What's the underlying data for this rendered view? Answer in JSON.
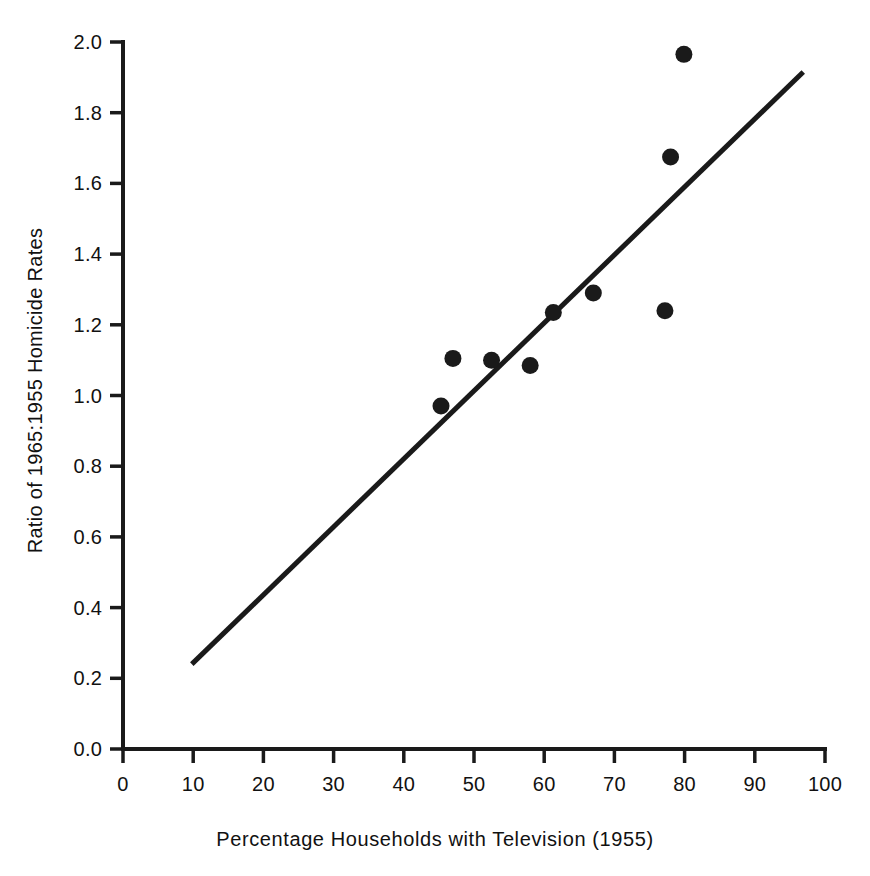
{
  "chart_data": {
    "type": "scatter",
    "title": "",
    "xlabel": "Percentage Households with Television (1955)",
    "ylabel": "Ratio of 1965:1955 Homicide Rates",
    "xlim": [
      0,
      100
    ],
    "ylim": [
      0.0,
      2.0
    ],
    "grid": false,
    "legend": "none",
    "xticks": [
      "0",
      "10",
      "20",
      "30",
      "40",
      "50",
      "60",
      "70",
      "80",
      "90",
      "100"
    ],
    "xtick_values": [
      0,
      10,
      20,
      30,
      40,
      50,
      60,
      70,
      80,
      90,
      100
    ],
    "yticks": [
      "0.0",
      "0.2",
      "0.4",
      "0.6",
      "0.8",
      "1.0",
      "1.2",
      "1.4",
      "1.6",
      "1.8",
      "2.0"
    ],
    "ytick_values": [
      0.0,
      0.2,
      0.4,
      0.6,
      0.8,
      1.0,
      1.2,
      1.4,
      1.6,
      1.8,
      2.0
    ],
    "marker_color": "#1a1a1a",
    "line_color": "#1a1a1a",
    "axis_color": "#1a1a1a",
    "points": [
      {
        "x": 45.3,
        "y": 0.97
      },
      {
        "x": 47.0,
        "y": 1.105
      },
      {
        "x": 52.5,
        "y": 1.1
      },
      {
        "x": 58.0,
        "y": 1.085
      },
      {
        "x": 61.3,
        "y": 1.235
      },
      {
        "x": 67.0,
        "y": 1.29
      },
      {
        "x": 77.2,
        "y": 1.24
      },
      {
        "x": 78.0,
        "y": 1.675
      },
      {
        "x": 79.9,
        "y": 1.965
      }
    ],
    "fit_line": {
      "name": "regression-line",
      "x_start": 9.8,
      "y_start": 0.24,
      "x_end": 96.9,
      "y_end": 1.915
    }
  }
}
